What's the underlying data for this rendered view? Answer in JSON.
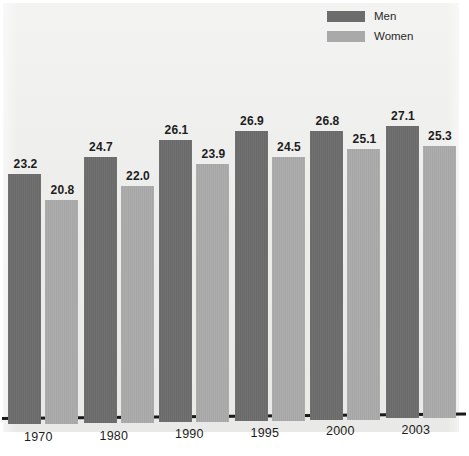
{
  "chart_data": {
    "type": "bar",
    "title": "",
    "subtitle": "",
    "xlabel": "",
    "ylabel": "",
    "categories": [
      "1970",
      "1980",
      "1990",
      "1995",
      "2000",
      "2003"
    ],
    "series": [
      {
        "name": "Men",
        "color": "#6c6c6c",
        "values": [
          23.2,
          24.7,
          26.1,
          26.9,
          26.8,
          27.1
        ]
      },
      {
        "name": "Women",
        "color": "#a9a9a9",
        "values": [
          20.8,
          22.0,
          23.9,
          24.5,
          25.1,
          25.3
        ]
      }
    ],
    "value_labels": [
      [
        "23.2",
        "20.8"
      ],
      [
        "24.7",
        "22.0"
      ],
      [
        "26.1",
        "23.9"
      ],
      [
        "26.9",
        "24.5"
      ],
      [
        "26.8",
        "25.1"
      ],
      [
        "27.1",
        "25.3"
      ]
    ],
    "ylim": [
      0,
      29.5
    ],
    "grid": false,
    "legend_position": "top-right",
    "axis_visible": {
      "x": true,
      "y": false
    },
    "background_color": "#efefed"
  },
  "legend": {
    "items": [
      {
        "label": "Men",
        "swatch": "men"
      },
      {
        "label": "Women",
        "swatch": "women"
      }
    ]
  },
  "axis": {
    "ticks": [
      "1970",
      "1980",
      "1990",
      "1995",
      "2000",
      "2003"
    ]
  }
}
